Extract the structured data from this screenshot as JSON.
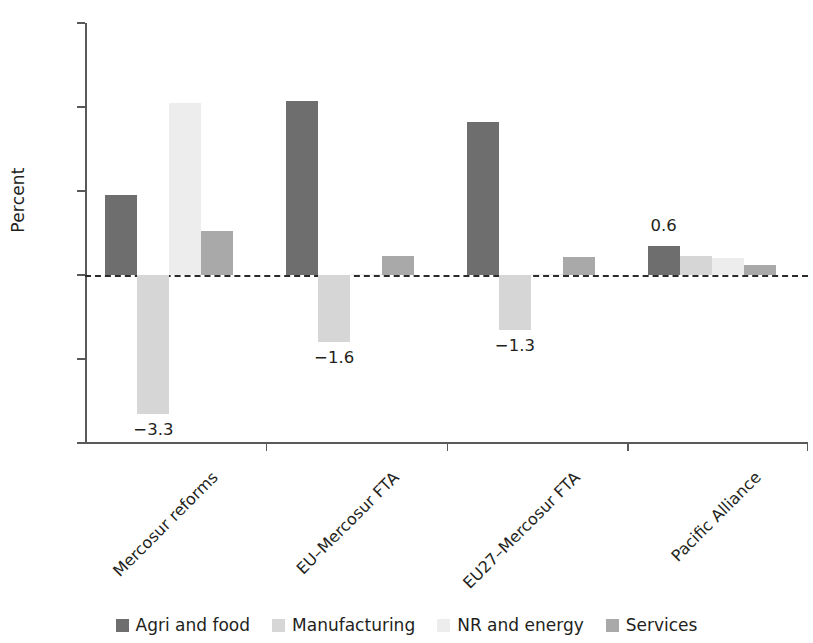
{
  "chart_data": {
    "type": "bar",
    "title": "",
    "subtitle": "",
    "xlabel": "",
    "ylabel": "Percent",
    "ylim": [
      -4,
      6
    ],
    "yticks": [
      6,
      4,
      2,
      0,
      -2,
      -4
    ],
    "ytick_labels": [
      "6",
      "4",
      "2",
      "0",
      "−2",
      "−4"
    ],
    "grid": false,
    "zero_line": true,
    "legend_position": "bottom",
    "categories": [
      "Mercosur reforms",
      "EU–Mercosur FTA",
      "EU27–Mercosur FTA",
      "Pacific Alliance"
    ],
    "series": [
      {
        "name": "Agri and food",
        "color": "#6e6e6e",
        "values": [
          1.9,
          4.15,
          3.65,
          0.68
        ]
      },
      {
        "name": "Manufacturing",
        "color": "#d6d6d6",
        "values": [
          -3.3,
          -1.6,
          -1.3,
          0.45
        ]
      },
      {
        "name": "NR and energy",
        "color": "#ededed",
        "values": [
          4.1,
          0.02,
          0.02,
          0.4
        ]
      },
      {
        "name": "Services",
        "color": "#a9a9a9",
        "values": [
          1.05,
          0.45,
          0.42,
          0.25
        ]
      }
    ],
    "data_labels": [
      {
        "text": "−3.3",
        "category": "Mercosur reforms",
        "series": "Manufacturing",
        "value": -3.3
      },
      {
        "text": "−1.6",
        "category": "EU–Mercosur FTA",
        "series": "Manufacturing",
        "value": -1.6
      },
      {
        "text": "−1.3",
        "category": "EU27–Mercosur FTA",
        "series": "Manufacturing",
        "value": -1.3
      },
      {
        "text": "0.6",
        "category": "Pacific Alliance",
        "series": "Agri and food",
        "value": 0.68
      }
    ]
  }
}
